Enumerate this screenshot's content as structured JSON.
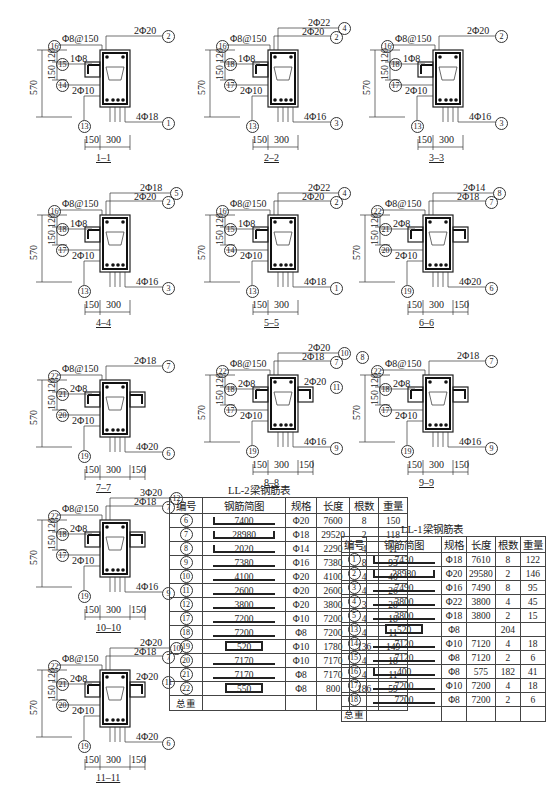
{
  "sections": [
    {
      "id": "1-1",
      "title": "1–1",
      "stirrup": "Φ8@150",
      "top_bars": [
        {
          "label": "2Φ20",
          "num": "2"
        }
      ],
      "bottom": {
        "label": "4Φ18",
        "num": "1"
      },
      "side": {
        "label": "1Φ8",
        "num": "15"
      },
      "waist": {
        "label": "2Φ10",
        "num": "14"
      },
      "stirrup_num": "16",
      "lower_num": "13",
      "dims_h": [
        "150",
        "300"
      ],
      "dims_v": [
        "570",
        "150",
        "120"
      ],
      "flanges": "left"
    },
    {
      "id": "2-2",
      "title": "2–2",
      "stirrup": "Φ8@150",
      "top_bars": [
        {
          "label": "2Φ22",
          "num": "4"
        },
        {
          "label": "2Φ20",
          "num": "2"
        }
      ],
      "bottom": {
        "label": "4Φ16",
        "num": "3"
      },
      "side": {
        "label": "1Φ8",
        "num": "18"
      },
      "waist": {
        "label": "2Φ10",
        "num": "17"
      },
      "stirrup_num": "16",
      "lower_num": "13",
      "dims_h": [
        "150",
        "300"
      ],
      "dims_v": [
        "570",
        "150",
        "120"
      ],
      "flanges": "left"
    },
    {
      "id": "3-3",
      "title": "3–3",
      "stirrup": "Φ8@150",
      "top_bars": [
        {
          "label": "2Φ20",
          "num": "2"
        }
      ],
      "bottom": {
        "label": "4Φ16",
        "num": "3"
      },
      "side": {
        "label": "1Φ8",
        "num": "18"
      },
      "waist": {
        "label": "2Φ10",
        "num": "17"
      },
      "stirrup_num": "16",
      "lower_num": "13",
      "dims_h": [
        "150",
        "300"
      ],
      "dims_v": [
        "570",
        "150",
        "120"
      ],
      "flanges": "left"
    },
    {
      "id": "4-4",
      "title": "4–4",
      "stirrup": "Φ8@150",
      "top_bars": [
        {
          "label": "2Φ18",
          "num": "5"
        },
        {
          "label": "2Φ20",
          "num": "2"
        }
      ],
      "bottom": {
        "label": "4Φ16",
        "num": "3"
      },
      "side": {
        "label": "1Φ8",
        "num": "18"
      },
      "waist": {
        "label": "2Φ10",
        "num": "17"
      },
      "stirrup_num": "16",
      "lower_num": "13",
      "dims_h": [
        "150",
        "300"
      ],
      "dims_v": [
        "570",
        "150",
        "120"
      ],
      "flanges": "left"
    },
    {
      "id": "5-5",
      "title": "5–5",
      "stirrup": "Φ8@150",
      "top_bars": [
        {
          "label": "2Φ22",
          "num": "4"
        },
        {
          "label": "2Φ20",
          "num": "2"
        }
      ],
      "bottom": {
        "label": "4Φ18",
        "num": "1"
      },
      "side": {
        "label": "1Φ8",
        "num": "15"
      },
      "waist": {
        "label": "2Φ10",
        "num": "14"
      },
      "stirrup_num": "16",
      "lower_num": "13",
      "dims_h": [
        "150",
        "300"
      ],
      "dims_v": [
        "570",
        "150",
        "120"
      ],
      "flanges": "left"
    },
    {
      "id": "6-6",
      "title": "6–6",
      "stirrup": "Φ8@150",
      "top_bars": [
        {
          "label": "2Φ14",
          "num": "8"
        },
        {
          "label": "2Φ18",
          "num": "7"
        }
      ],
      "bottom": {
        "label": "4Φ20",
        "num": "6"
      },
      "side": {
        "label": "2Φ8",
        "num": "21"
      },
      "waist": {
        "label": "2Φ10",
        "num": "20"
      },
      "stirrup_num": "22",
      "lower_num": "19",
      "dims_h": [
        "150",
        "300",
        "150"
      ],
      "dims_v": [
        "570",
        "150",
        "120"
      ],
      "flanges": "both"
    },
    {
      "id": "7-7",
      "title": "7–7",
      "stirrup": "Φ8@150",
      "top_bars": [
        {
          "label": "2Φ18",
          "num": "7"
        }
      ],
      "bottom": {
        "label": "4Φ20",
        "num": "6"
      },
      "side": {
        "label": "2Φ8",
        "num": "21"
      },
      "waist": {
        "label": "2Φ10",
        "num": "20"
      },
      "stirrup_num": "22",
      "lower_num": "19",
      "dims_h": [
        "150",
        "300",
        "150"
      ],
      "dims_v": [
        "570",
        "150",
        "120"
      ],
      "flanges": "both"
    },
    {
      "id": "8-8",
      "title": "8–8",
      "stirrup": "Φ8@150",
      "top_bars": [
        {
          "label": "2Φ20",
          "num": "10"
        },
        {
          "label": "2Φ18",
          "num": "7"
        }
      ],
      "extra_num": "8",
      "flange_bar": {
        "label": "2Φ20",
        "num": "11"
      },
      "bottom": {
        "label": "4Φ16",
        "num": "9"
      },
      "side": {
        "label": "2Φ8",
        "num": "18"
      },
      "waist": {
        "label": "2Φ10",
        "num": "17"
      },
      "stirrup_num": "22",
      "lower_num": "19",
      "dims_h": [
        "150",
        "300",
        "150"
      ],
      "dims_v": [
        "570",
        "150",
        "120"
      ],
      "flanges": "both"
    },
    {
      "id": "9-9",
      "title": "9–9",
      "stirrup": "Φ8@150",
      "top_bars": [
        {
          "label": "2Φ18",
          "num": "7"
        }
      ],
      "bottom": {
        "label": "4Φ16",
        "num": "9"
      },
      "side": {
        "label": "2Φ8",
        "num": "18"
      },
      "waist": {
        "label": "2Φ10",
        "num": "17"
      },
      "stirrup_num": "22",
      "lower_num": "19",
      "dims_h": [
        "150",
        "300",
        "150"
      ],
      "dims_v": [
        "570",
        "150",
        "120"
      ],
      "flanges": "both"
    },
    {
      "id": "10-10",
      "title": "10–10",
      "stirrup": "Φ8@150",
      "top_bars": [
        {
          "label": "3Φ20",
          "num": "12"
        },
        {
          "label": "2Φ18",
          "num": "7"
        }
      ],
      "bottom": {
        "label": "4Φ16",
        "num": "9"
      },
      "side": {
        "label": "2Φ8",
        "num": "18"
      },
      "waist": {
        "label": "2Φ10",
        "num": "17"
      },
      "stirrup_num": "22",
      "lower_num": "19",
      "dims_h": [
        "150",
        "300",
        "150"
      ],
      "dims_v": [
        "570",
        "150",
        "120"
      ],
      "flanges": "both"
    },
    {
      "id": "11-11",
      "title": "11–11",
      "stirrup": "Φ8@150",
      "top_bars": [
        {
          "label": "2Φ20",
          "num": "10"
        },
        {
          "label": "2Φ18",
          "num": "7"
        }
      ],
      "flange_bar": {
        "label": "2Φ20",
        "num": "11"
      },
      "bottom": {
        "label": "4Φ20",
        "num": "6"
      },
      "side": {
        "label": "2Φ8",
        "num": "21"
      },
      "waist": {
        "label": "2Φ10",
        "num": "20"
      },
      "stirrup_num": "22",
      "lower_num": "19",
      "dims_h": [
        "150",
        "300",
        "150"
      ],
      "dims_v": [
        "570",
        "150",
        "120"
      ],
      "flanges": "both"
    }
  ],
  "table_ll2": {
    "title": "LL-2梁钢筋表",
    "headers": [
      "编号",
      "钢筋简图",
      "规格",
      "长度",
      "根数",
      "重量"
    ],
    "rows": [
      {
        "no": "6",
        "shape": "7400",
        "shape_type": "hookL",
        "spec": "Φ20",
        "length": "7600",
        "count": "8",
        "weight": "150"
      },
      {
        "no": "7",
        "shape": "28980",
        "shape_type": "hookLR",
        "spec": "Φ18",
        "length": "29520",
        "count": "2",
        "weight": "118"
      },
      {
        "no": "8",
        "shape": "2020",
        "shape_type": "hookL",
        "spec": "Φ14",
        "length": "2290",
        "count": "4",
        "weight": "11"
      },
      {
        "no": "9",
        "shape": "7380",
        "shape_type": "line",
        "spec": "Φ16",
        "length": "7380",
        "count": "8",
        "weight": "93"
      },
      {
        "no": "10",
        "shape": "4100",
        "shape_type": "line",
        "spec": "Φ20",
        "length": "4100",
        "count": "4",
        "weight": "40"
      },
      {
        "no": "11",
        "shape": "2600",
        "shape_type": "line",
        "spec": "Φ20",
        "length": "2600",
        "count": "4",
        "weight": "26"
      },
      {
        "no": "12",
        "shape": "3800",
        "shape_type": "line",
        "spec": "Φ20",
        "length": "3800",
        "count": "3",
        "weight": "28"
      },
      {
        "no": "17",
        "shape": "7200",
        "shape_type": "line",
        "spec": "Φ10",
        "length": "7200",
        "count": "4",
        "weight": "18"
      },
      {
        "no": "18",
        "shape": "7200",
        "shape_type": "line",
        "spec": "Φ8",
        "length": "7200",
        "count": "4",
        "weight": "11"
      },
      {
        "no": "19",
        "shape": "520",
        "shape_type": "box",
        "spec": "Φ10",
        "length": "1780",
        "count": "136",
        "weight": "149"
      },
      {
        "no": "20",
        "shape": "7170",
        "shape_type": "line",
        "spec": "Φ10",
        "length": "7170",
        "count": "4",
        "weight": "18"
      },
      {
        "no": "21",
        "shape": "7170",
        "shape_type": "line",
        "spec": "Φ8",
        "length": "7170",
        "count": "4",
        "weight": "11"
      },
      {
        "no": "22",
        "shape": "550",
        "shape_type": "box",
        "spec": "Φ8",
        "length": "800",
        "count": "186",
        "weight": "59"
      }
    ],
    "total_label": "总重"
  },
  "table_ll1": {
    "title": "LL-1梁钢筋表",
    "headers": [
      "编号",
      "钢筋简图",
      "规格",
      "长度",
      "根数",
      "重量"
    ],
    "rows": [
      {
        "no": "1",
        "shape": "7430",
        "shape_type": "hookL",
        "spec": "Φ18",
        "length": "7610",
        "count": "8",
        "weight": "122"
      },
      {
        "no": "2",
        "shape": "28980",
        "shape_type": "hookLR",
        "spec": "Φ20",
        "length": "29580",
        "count": "2",
        "weight": "146"
      },
      {
        "no": "3",
        "shape": "7490",
        "shape_type": "line",
        "spec": "Φ16",
        "length": "7490",
        "count": "8",
        "weight": "95"
      },
      {
        "no": "4",
        "shape": "3800",
        "shape_type": "line",
        "spec": "Φ22",
        "length": "3800",
        "count": "4",
        "weight": "45"
      },
      {
        "no": "5",
        "shape": "3800",
        "shape_type": "line",
        "spec": "Φ18",
        "length": "3800",
        "count": "2",
        "weight": "15"
      },
      {
        "no": "13",
        "shape": "520",
        "shape_type": "box",
        "spec": "Φ8",
        "length": "",
        "count": "204",
        "weight": ""
      },
      {
        "no": "14",
        "shape": "7120",
        "shape_type": "line",
        "spec": "Φ10",
        "length": "7120",
        "count": "4",
        "weight": "18"
      },
      {
        "no": "15",
        "shape": "7120",
        "shape_type": "line",
        "spec": "Φ8",
        "length": "7120",
        "count": "2",
        "weight": "6"
      },
      {
        "no": "16",
        "shape": "400",
        "shape_type": "hookL",
        "spec": "Φ8",
        "length": "575",
        "count": "182",
        "weight": "41"
      },
      {
        "no": "17",
        "shape": "7200",
        "shape_type": "line",
        "spec": "Φ10",
        "length": "7200",
        "count": "4",
        "weight": "18"
      },
      {
        "no": "18",
        "shape": "7200",
        "shape_type": "line",
        "spec": "Φ8",
        "length": "7200",
        "count": "2",
        "weight": "6"
      }
    ],
    "total_label": "总重"
  }
}
